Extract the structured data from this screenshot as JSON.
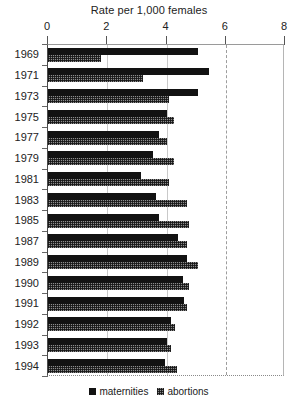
{
  "chart_data": {
    "type": "bar",
    "orientation": "horizontal",
    "title": "Rate per 1,000 females",
    "xlabel": "",
    "ylabel": "",
    "xlim": [
      0,
      8
    ],
    "xticks": [
      0,
      2,
      4,
      6,
      8
    ],
    "xtick_labels": [
      "0",
      "2",
      "4",
      "6",
      "8"
    ],
    "grid": true,
    "gridlines_at": [
      2,
      4,
      8
    ],
    "reference_line": 6,
    "reference_line_style": "dashed",
    "legend_position": "bottom-center",
    "categories": [
      "1969",
      "1971",
      "1973",
      "1975",
      "1977",
      "1979",
      "1981",
      "1983",
      "1985",
      "1987",
      "1989",
      "1990",
      "1991",
      "1992",
      "1993",
      "1994"
    ],
    "series": [
      {
        "name": "maternities",
        "color": "#121212",
        "pattern": "solid",
        "values": [
          5.05,
          5.45,
          5.05,
          4.0,
          3.75,
          3.55,
          3.15,
          3.65,
          3.75,
          4.4,
          4.7,
          4.55,
          4.6,
          4.15,
          4.0,
          3.95
        ]
      },
      {
        "name": "abortions",
        "color": "#8d8d8d",
        "pattern": "checkered",
        "values": [
          1.8,
          3.2,
          4.1,
          4.25,
          4.0,
          4.25,
          4.1,
          4.7,
          4.75,
          4.7,
          5.05,
          4.75,
          4.7,
          4.3,
          4.15,
          4.35
        ]
      }
    ]
  },
  "legend": {
    "items": [
      {
        "label": "maternities"
      },
      {
        "label": "abortions"
      }
    ]
  }
}
